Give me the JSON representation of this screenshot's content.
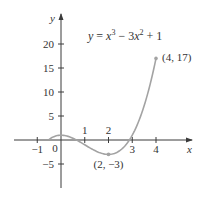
{
  "chart_data": {
    "type": "line",
    "title": "",
    "equation": "y = x³ − 3x² + 1",
    "equation_parts": {
      "y": "y",
      "eq": " = ",
      "x1": "x",
      "e1": "3",
      "mid": " − 3",
      "x2": "x",
      "e2": "2",
      "tail": " + 1"
    },
    "xlabel": "x",
    "ylabel": "y",
    "xlim": [
      -1.6,
      5.4
    ],
    "ylim": [
      -10,
      26
    ],
    "x_ticks": [
      -1,
      1,
      2,
      3,
      4
    ],
    "x_tick_labels": [
      "−1",
      "1",
      "2",
      "3",
      "4"
    ],
    "origin_label": "0",
    "y_ticks": [
      -5,
      5,
      10,
      15,
      20
    ],
    "y_tick_labels": [
      "−5",
      "5",
      "10",
      "15",
      "20"
    ],
    "grid": false,
    "legend": null,
    "series": [
      {
        "name": "y = x^3 - 3x^2 + 1",
        "x_range": [
          -0.5,
          4
        ],
        "points": [
          [
            -0.5,
            0.125
          ],
          [
            0,
            1
          ],
          [
            0.5,
            0.375
          ],
          [
            1,
            -1
          ],
          [
            1.5,
            -2.375
          ],
          [
            2,
            -3
          ],
          [
            2.5,
            -2.125
          ],
          [
            3,
            1
          ],
          [
            3.5,
            7.125
          ],
          [
            4,
            17
          ]
        ]
      }
    ],
    "annotations": [
      {
        "point": [
          2,
          -3
        ],
        "label": "(2, −3)"
      },
      {
        "point": [
          4,
          17
        ],
        "label": "(4, 17)"
      }
    ],
    "colors": {
      "curve": "#a3a3a3",
      "axis": "#3a3a3a",
      "text": "#333333"
    }
  }
}
